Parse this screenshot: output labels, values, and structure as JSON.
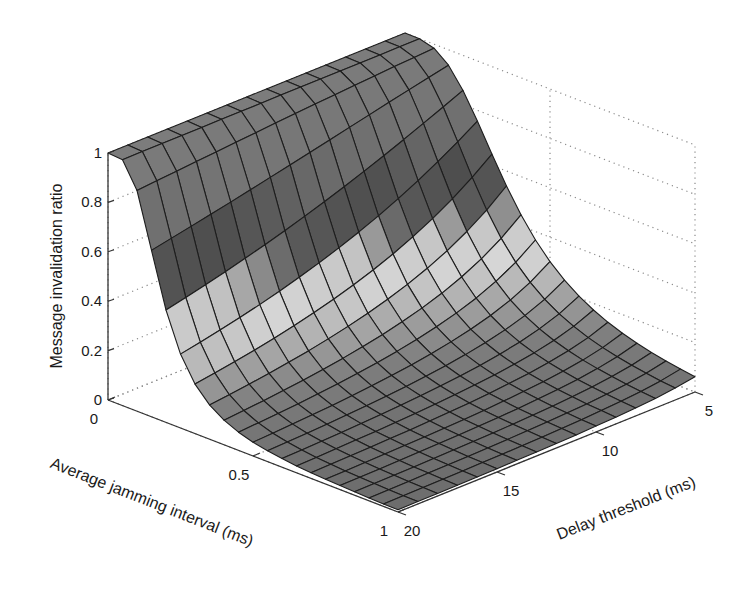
{
  "chart_data": {
    "type": "surface",
    "title": "",
    "xlabel": "Average jamming interval (ms)",
    "ylabel": "Delay threshold (ms)",
    "zlabel": "Message invalidation ratio",
    "x_ticks": [
      "0",
      "0.5",
      "1"
    ],
    "x_tick_values": [
      0,
      0.5,
      1
    ],
    "y_ticks": [
      "5",
      "10",
      "15",
      "20"
    ],
    "y_tick_values": [
      5,
      10,
      15,
      20
    ],
    "z_ticks": [
      "0",
      "0.2",
      "0.4",
      "0.6",
      "0.8",
      "1"
    ],
    "z_tick_values": [
      0,
      0.2,
      0.4,
      0.6,
      0.8,
      1
    ],
    "xlim": [
      0,
      1
    ],
    "ylim": [
      5,
      20
    ],
    "zlim": [
      0,
      1
    ],
    "grid": true,
    "x": [
      0,
      0.05,
      0.1,
      0.15,
      0.2,
      0.25,
      0.3,
      0.35,
      0.4,
      0.45,
      0.5,
      0.55,
      0.6,
      0.65,
      0.7,
      0.75,
      0.8,
      0.85,
      0.9,
      0.95,
      1.0
    ],
    "y": [
      5,
      6,
      7,
      8,
      9,
      10,
      11,
      12,
      13,
      14,
      15,
      16,
      17,
      18,
      19,
      20
    ],
    "z_description": "Ratio ≈ 1 for jamming interval near 0, drops steeply to ≈ 0 as jamming interval grows; drop is steeper for larger delay thresholds",
    "z_model": {
      "form": "1/(1+((x-x0)/a)^b), a = a5*(5/y)^g",
      "x0": 0.03,
      "a5": 0.34,
      "g": 0.55,
      "b": 2.6
    },
    "colormap": [
      {
        "z": 0.0,
        "color": "#6c6c6c"
      },
      {
        "z": 0.12,
        "color": "#7e7e7e"
      },
      {
        "z": 0.22,
        "color": "#a8a8a8"
      },
      {
        "z": 0.32,
        "color": "#d6d6d6"
      },
      {
        "z": 0.42,
        "color": "#c4c4c4"
      },
      {
        "z": 0.5,
        "color": "#5a5a5a"
      },
      {
        "z": 0.62,
        "color": "#4e4e4e"
      },
      {
        "z": 0.72,
        "color": "#6a6a6a"
      },
      {
        "z": 0.85,
        "color": "#767676"
      },
      {
        "z": 1.0,
        "color": "#7c7c7c"
      }
    ]
  },
  "colors": {
    "background": "#ffffff",
    "axis": "#333333",
    "grid": "#8a8a8a",
    "edge": "#1e1e1e"
  }
}
